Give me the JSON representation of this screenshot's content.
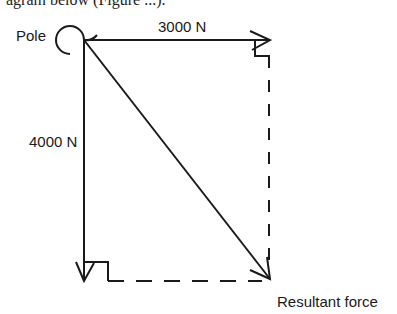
{
  "caption_fragment": "agram below (Figure ...).",
  "diagram": {
    "labels": {
      "pole": "Pole",
      "horizontal_force": "3000 N",
      "vertical_force": "4000 N",
      "resultant": "Resultant force"
    },
    "colors": {
      "line": "#1a1a1a",
      "background": "#ffffff"
    }
  }
}
